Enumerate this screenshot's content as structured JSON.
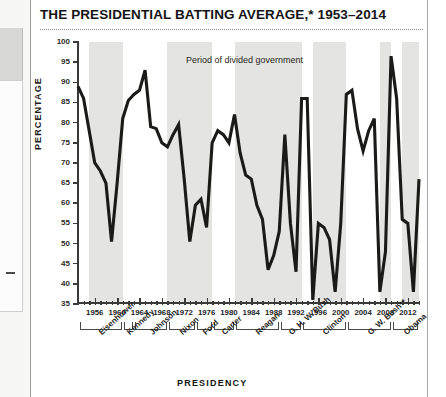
{
  "header": {
    "title": "THE PRESIDENTIAL BATTING AVERAGE,* 1953–2014"
  },
  "legend": {
    "label": "Period of divided government",
    "swatch_color": "#e4e4e2"
  },
  "axes": {
    "y_title": "PERCENTAGE",
    "x_title": "PRESIDENCY"
  },
  "chart_data": {
    "type": "line",
    "title": "THE PRESIDENTIAL BATTING AVERAGE,* 1953–2014",
    "xlabel": "PRESIDENCY",
    "ylabel": "PERCENTAGE",
    "xlim": [
      1953,
      2014
    ],
    "ylim": [
      35,
      100
    ],
    "ytick_labels": [
      "35",
      "40",
      "45",
      "50",
      "55",
      "60",
      "65",
      "70",
      "75",
      "80",
      "85",
      "90",
      "95",
      "100"
    ],
    "yticks": [
      35,
      40,
      45,
      50,
      55,
      60,
      65,
      70,
      75,
      80,
      85,
      90,
      95,
      100
    ],
    "xtick_labels": [
      "1956",
      "1960",
      "1964",
      "1968",
      "1972",
      "1976",
      "1980",
      "1984",
      "1988",
      "1992",
      "1996",
      "2000",
      "2004",
      "2008",
      "2012"
    ],
    "xticks": [
      1956,
      1960,
      1964,
      1968,
      1972,
      1976,
      1980,
      1984,
      1988,
      1992,
      1996,
      2000,
      2004,
      2008,
      2012
    ],
    "grid": false,
    "legend_position": "top-center",
    "series": [
      {
        "name": "Presidential batting average",
        "color": "#1a1a18",
        "x": [
          1953,
          1954,
          1955,
          1956,
          1957,
          1958,
          1959,
          1960,
          1961,
          1962,
          1963,
          1964,
          1965,
          1966,
          1967,
          1968,
          1969,
          1970,
          1971,
          1972,
          1973,
          1974,
          1975,
          1976,
          1977,
          1978,
          1979,
          1980,
          1981,
          1982,
          1983,
          1984,
          1985,
          1986,
          1987,
          1988,
          1989,
          1990,
          1991,
          1992,
          1993,
          1994,
          1995,
          1996,
          1997,
          1998,
          1999,
          2000,
          2001,
          2002,
          2003,
          2004,
          2005,
          2006,
          2007,
          2008,
          2009,
          2010,
          2011,
          2012,
          2013,
          2014
        ],
        "values": [
          89,
          86,
          78,
          70,
          68,
          65,
          50.5,
          65,
          81,
          85.5,
          87,
          88,
          93,
          79,
          78.5,
          75,
          74,
          77,
          79.5,
          66,
          50.5,
          59.5,
          61,
          54,
          75,
          78,
          77,
          75,
          82,
          72.5,
          67,
          66,
          59.5,
          56,
          43.5,
          47,
          53,
          77,
          55,
          43,
          86,
          86,
          36,
          55,
          54,
          51,
          38,
          55,
          87,
          88,
          78.5,
          73,
          78,
          81,
          38,
          48,
          96.5,
          86,
          56,
          55,
          38,
          66
        ]
      }
    ],
    "shaded_bands": [
      {
        "label": "Period of divided government",
        "start": 1955,
        "end": 1961
      },
      {
        "label": "Period of divided government",
        "start": 1969,
        "end": 1977
      },
      {
        "label": "Period of divided government",
        "start": 1981,
        "end": 1993
      },
      {
        "label": "Period of divided government",
        "start": 1995,
        "end": 2001
      },
      {
        "label": "Period of divided government",
        "start": 2007,
        "end": 2009
      },
      {
        "label": "Period of divided government",
        "start": 2011,
        "end": 2014
      }
    ],
    "presidents": [
      {
        "name": "Eisenhower",
        "start": 1953,
        "end": 1961
      },
      {
        "name": "Kennedy",
        "start": 1961,
        "end": 1963
      },
      {
        "name": "Johnson",
        "start": 1963,
        "end": 1969
      },
      {
        "name": "Nixon",
        "start": 1969,
        "end": 1974
      },
      {
        "name": "Ford",
        "start": 1974,
        "end": 1977
      },
      {
        "name": "Carter",
        "start": 1977,
        "end": 1981
      },
      {
        "name": "Reagan",
        "start": 1981,
        "end": 1989
      },
      {
        "name": "G. H. W. Bush",
        "start": 1989,
        "end": 1993
      },
      {
        "name": "Clinton",
        "start": 1993,
        "end": 2001
      },
      {
        "name": "G. W. Bush**",
        "start": 2001,
        "end": 2009
      },
      {
        "name": "Obama",
        "start": 2009,
        "end": 2014
      }
    ]
  }
}
